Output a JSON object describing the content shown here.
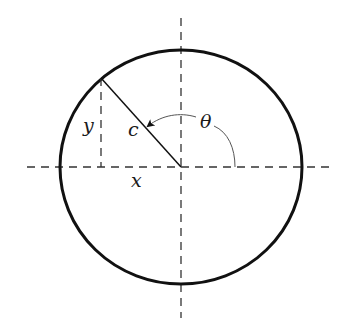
{
  "diagram": {
    "type": "polar-coordinates-circle",
    "labels": {
      "x": "x",
      "y": "y",
      "c": "c",
      "theta": "θ"
    },
    "colors": {
      "stroke": "#111111",
      "dash": "#333333",
      "arrow": "#555555",
      "background": "#ffffff"
    }
  }
}
